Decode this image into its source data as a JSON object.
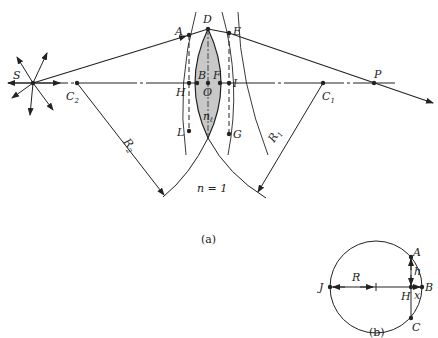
{
  "figure_a": {
    "caption": "(a)",
    "medium_label": "n = 1",
    "lens_index_label": "n",
    "lens_index_sub": "ℓ",
    "points": {
      "S": "S",
      "C2": "C",
      "C2_sub": "2",
      "C1": "C",
      "C1_sub": "1",
      "A": "A",
      "D": "D",
      "E": "E",
      "B": "B",
      "F": "F",
      "O": "O",
      "H": "H",
      "I": "I",
      "L": "L",
      "G": "G",
      "P": "P"
    },
    "radii": {
      "R2": "R",
      "R2_sub": "2",
      "R1": "R",
      "R1_sub": "1"
    },
    "colors": {
      "lens_fill": "#c8c8c8",
      "line": "#222222"
    }
  },
  "figure_b": {
    "caption": "(b)",
    "points": {
      "J": "J",
      "A": "A",
      "B": "B",
      "C": "C",
      "H": "H"
    },
    "labels": {
      "R": "R",
      "h": "h",
      "x": "x"
    }
  }
}
